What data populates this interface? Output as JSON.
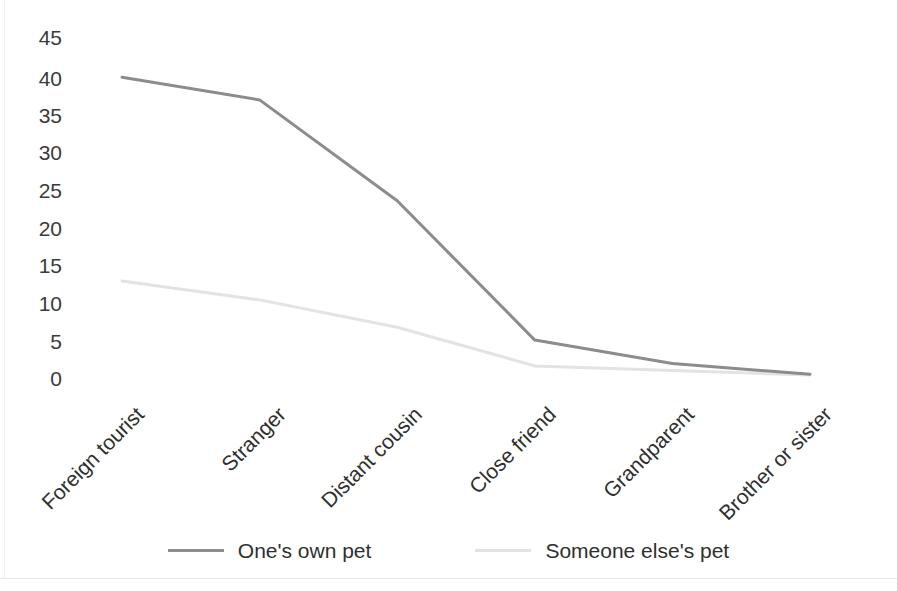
{
  "chart_data": {
    "type": "line",
    "title": "",
    "subtitle": "",
    "xlabel": "",
    "ylabel": "",
    "ylim": [
      0,
      45
    ],
    "yticks": [
      45,
      40,
      35,
      30,
      25,
      20,
      15,
      10,
      5,
      0
    ],
    "grid": false,
    "legend_position": "bottom",
    "categories": [
      "Foreign tourist",
      "Stranger",
      "Distant cousin",
      "Close friend",
      "Grandparent",
      "Brother or sister"
    ],
    "series": [
      {
        "name": "One's own pet",
        "color": "#8c8c8c",
        "values": [
          39.7,
          36.7,
          23.4,
          5.0,
          1.9,
          0.5
        ]
      },
      {
        "name": "Someone else's pet",
        "color": "#e3e3e3",
        "values": [
          12.8,
          10.3,
          6.7,
          1.6,
          1.0,
          0.4
        ]
      }
    ]
  },
  "axis": {
    "y_tick_labels": [
      "45",
      "40",
      "35",
      "30",
      "25",
      "20",
      "15",
      "10",
      "5",
      "0"
    ]
  },
  "legend": {
    "items": [
      {
        "label": "One's own pet",
        "color": "#8c8c8c"
      },
      {
        "label": "Someone else's pet",
        "color": "#e3e3e3"
      }
    ]
  },
  "colors": {
    "series_own_pet": "#8c8c8c",
    "series_other_pet": "#e3e3e3",
    "text": "#2f2f2f",
    "background": "#ffffff"
  }
}
